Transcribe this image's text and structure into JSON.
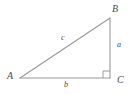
{
  "figure": {
    "type": "right-triangle-geometry-diagram",
    "background_color": "#ffffff",
    "stroke_color": "#9a9a9a",
    "label_color": "#4a4a4a",
    "vertices": [
      {
        "id": "A",
        "label": "A",
        "x": 20,
        "y": 78,
        "angle": "acute"
      },
      {
        "id": "B",
        "label": "B",
        "x": 110,
        "y": 18,
        "angle": "acute"
      },
      {
        "id": "C",
        "label": "C",
        "x": 110,
        "y": 78,
        "angle": "right"
      }
    ],
    "sides": [
      {
        "id": "a",
        "label": "a",
        "from": "B",
        "to": "C",
        "description": "vertical-leg-opposite-A"
      },
      {
        "id": "b",
        "label": "b",
        "from": "A",
        "to": "C",
        "description": "horizontal-leg-opposite-B"
      },
      {
        "id": "c",
        "label": "c",
        "from": "A",
        "to": "B",
        "description": "hypotenuse-opposite-C"
      }
    ],
    "right_angle_marker": {
      "at_vertex": "C",
      "name": "right-angle-square",
      "size": 7
    }
  }
}
